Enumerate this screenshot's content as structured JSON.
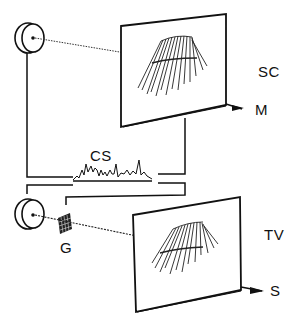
{
  "figure": {
    "labels": {
      "scanner_top": "SC",
      "scanner_top_marker": "M",
      "cable_signal": "CS",
      "grid": "G",
      "tv_display": "TV",
      "tv_display_marker": "S"
    },
    "colors": {
      "ink": "#111111",
      "background": "#ffffff"
    }
  }
}
